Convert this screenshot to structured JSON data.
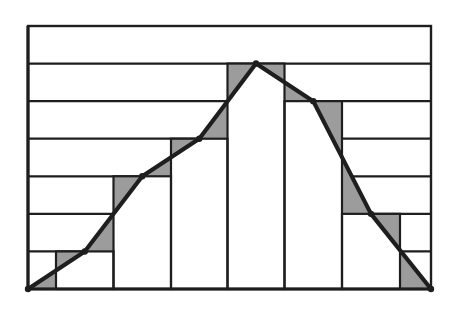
{
  "chart_data": {
    "type": "bar",
    "subtype": "histogram-with-frequency-polygon",
    "title": "",
    "xlabel": "",
    "ylabel": "",
    "categories": [
      "1",
      "2",
      "3",
      "4",
      "5",
      "6"
    ],
    "values": [
      1,
      3,
      4,
      6,
      5,
      2
    ],
    "polygon_points": [
      0,
      1,
      3,
      4,
      6,
      5,
      2,
      0
    ],
    "ylim": [
      0,
      7
    ],
    "grid": true,
    "legend": null,
    "shaded_regions": "triangles between bar tops and frequency polygon",
    "annotations": []
  },
  "colors": {
    "background": "#ffffff",
    "line": "#1e1e1e",
    "bar_fill": "#ffffff",
    "shade": "#9c9c9c"
  },
  "layout": {
    "x_left": 28,
    "x_right": 431,
    "y_bottom": 289,
    "y_top": 26,
    "bar_edges": [
      56,
      113.5,
      171,
      227.5,
      284.5,
      342,
      400
    ],
    "unit_px": 37.6
  }
}
